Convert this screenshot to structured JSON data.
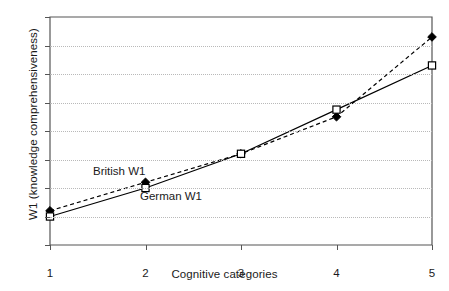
{
  "chart_data": {
    "type": "line",
    "title": "",
    "xlabel": "Cognitive categories",
    "ylabel": "W1 (knowledge comprehensiveness)",
    "x": [
      1,
      2,
      3,
      4,
      5
    ],
    "categories": [
      "1",
      "2",
      "3",
      "4",
      "5"
    ],
    "xlim": [
      1,
      5
    ],
    "ylim": [
      0,
      160
    ],
    "ytick_labels": [
      "0",
      "20",
      "40",
      "60",
      "80",
      "100",
      "120",
      "140",
      "160"
    ],
    "yticks": [
      0,
      20,
      40,
      60,
      80,
      100,
      120,
      140,
      160
    ],
    "grid": "horizontal-dotted",
    "legend_position": "inline-annotations",
    "series": [
      {
        "name": "British W1",
        "values": [
          24,
          44,
          64,
          90,
          146
        ],
        "line_style": "dashed",
        "marker": "filled-diamond",
        "color": "#000000"
      },
      {
        "name": "German W1",
        "values": [
          20,
          40,
          64,
          95,
          126
        ],
        "line_style": "solid",
        "marker": "open-square",
        "color": "#000000"
      }
    ],
    "annotations": [
      {
        "text": "British W1",
        "x": 1.55,
        "y": 57
      },
      {
        "text": "German W1",
        "x": 2.05,
        "y": 32
      }
    ],
    "colors": {
      "axis": "#555555",
      "grid": "#b9b9b9",
      "series": "#000000",
      "background": "#ffffff"
    }
  }
}
